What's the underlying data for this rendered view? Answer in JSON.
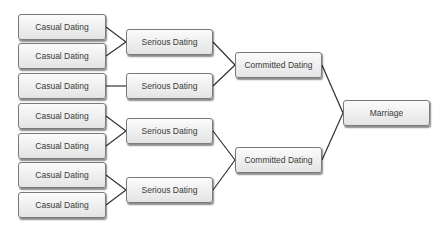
{
  "diagram": {
    "type": "bracket-tree",
    "colors": {
      "box_border": "#7a7a7a",
      "box_fill_top": "#fbfbfb",
      "box_fill_bottom": "#e4e4e4",
      "line": "#333333",
      "text": "#3a3a3a"
    },
    "nodes": [
      {
        "id": "c1",
        "label": "Casual Dating",
        "x": 18,
        "y": 14,
        "w": 88,
        "h": 26
      },
      {
        "id": "c2",
        "label": "Casual Dating",
        "x": 18,
        "y": 43,
        "w": 88,
        "h": 26
      },
      {
        "id": "c3",
        "label": "Casual Dating",
        "x": 18,
        "y": 73,
        "w": 88,
        "h": 26
      },
      {
        "id": "c4",
        "label": "Casual Dating",
        "x": 18,
        "y": 103,
        "w": 88,
        "h": 26
      },
      {
        "id": "c5",
        "label": "Casual Dating",
        "x": 18,
        "y": 133,
        "w": 88,
        "h": 26
      },
      {
        "id": "c6",
        "label": "Casual Dating",
        "x": 18,
        "y": 162,
        "w": 88,
        "h": 26
      },
      {
        "id": "c7",
        "label": "Casual Dating",
        "x": 18,
        "y": 192,
        "w": 88,
        "h": 26
      },
      {
        "id": "s1",
        "label": "Serious Dating",
        "x": 126,
        "y": 29,
        "w": 87,
        "h": 26
      },
      {
        "id": "s2",
        "label": "Serious Dating",
        "x": 126,
        "y": 73,
        "w": 87,
        "h": 26
      },
      {
        "id": "s3",
        "label": "Serious Dating",
        "x": 126,
        "y": 118,
        "w": 87,
        "h": 26
      },
      {
        "id": "s4",
        "label": "Serious Dating",
        "x": 126,
        "y": 177,
        "w": 87,
        "h": 26
      },
      {
        "id": "m1",
        "label": "Committed Dating",
        "x": 235,
        "y": 52,
        "w": 87,
        "h": 26
      },
      {
        "id": "m2",
        "label": "Committed Dating",
        "x": 235,
        "y": 147,
        "w": 87,
        "h": 26
      },
      {
        "id": "f1",
        "label": "Marriage",
        "x": 343,
        "y": 100,
        "w": 87,
        "h": 26
      }
    ],
    "edges": [
      {
        "from": "c1",
        "to": "s1"
      },
      {
        "from": "c2",
        "to": "s1"
      },
      {
        "from": "c3",
        "to": "s2"
      },
      {
        "from": "c4",
        "to": "s3"
      },
      {
        "from": "c5",
        "to": "s3"
      },
      {
        "from": "c6",
        "to": "s4"
      },
      {
        "from": "c7",
        "to": "s4"
      },
      {
        "from": "s1",
        "to": "m1"
      },
      {
        "from": "s2",
        "to": "m1"
      },
      {
        "from": "s3",
        "to": "m2"
      },
      {
        "from": "s4",
        "to": "m2"
      },
      {
        "from": "m1",
        "to": "f1"
      },
      {
        "from": "m2",
        "to": "f1"
      }
    ]
  }
}
